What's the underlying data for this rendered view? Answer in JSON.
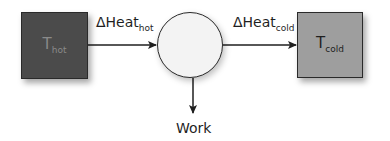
{
  "diagram": {
    "type": "heat-engine",
    "nodes": {
      "hot_reservoir": {
        "symbol": "T",
        "subscript": "hot",
        "fill": "#4b4b4b"
      },
      "engine": {
        "shape": "circle",
        "fill": "#f3f3f3"
      },
      "cold_reservoir": {
        "symbol": "T",
        "subscript": "cold",
        "fill": "#9e9e9e"
      }
    },
    "edges": {
      "heat_in": {
        "prefix": "ΔHeat",
        "subscript": "hot",
        "from": "hot_reservoir",
        "to": "engine"
      },
      "heat_out": {
        "prefix": "ΔHeat",
        "subscript": "cold",
        "from": "engine",
        "to": "cold_reservoir"
      },
      "work": {
        "label": "Work",
        "from": "engine",
        "to": "output"
      }
    }
  }
}
